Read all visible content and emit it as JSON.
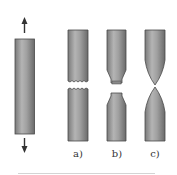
{
  "diagram": {
    "specimens": [
      {
        "id": "original",
        "label": "",
        "description": "unloaded specimen with tensile load arrows"
      },
      {
        "id": "a",
        "label": "a)",
        "description": "brittle fracture, flat jagged break"
      },
      {
        "id": "b",
        "label": "b)",
        "description": "moderately ductile cup-and-cone fracture"
      },
      {
        "id": "c",
        "label": "c)",
        "description": "highly ductile fracture, necking to a point"
      }
    ],
    "arrows": {
      "up": "tension-arrow-up",
      "down": "tension-arrow-down"
    },
    "colors": {
      "bar_dark": "#6e6e6e",
      "bar_mid": "#9a9a9a",
      "bar_light": "#b8b8b8",
      "outline": "#4a4a4a",
      "arrow": "#333333"
    }
  }
}
